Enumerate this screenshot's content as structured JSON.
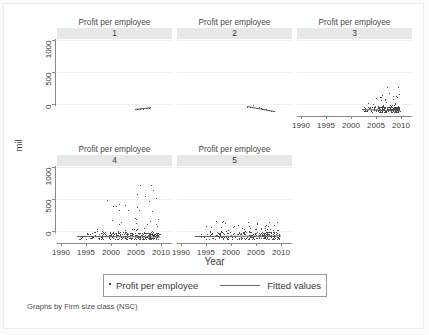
{
  "figure": {
    "y_axis_title": "mil",
    "x_axis_title": "Year",
    "footnote": "Graphs by Firm size class (NSC)",
    "panel_title": "Profit per employee"
  },
  "legend": {
    "marker_label": "Profit per employee",
    "line_label": "Fitted values"
  },
  "chart_data": {
    "type": "scatter",
    "title": "Profit per employee",
    "xlabel": "Year",
    "ylabel": "mil",
    "grid": true,
    "legend_position": "bottom",
    "xlim": [
      1988,
      2011
    ],
    "ylim": [
      -60,
      1180
    ],
    "xticks": [
      1990,
      1995,
      2000,
      2005,
      2010
    ],
    "yticks": [
      0,
      500,
      1000
    ],
    "facet_by": "Firm size class (NSC)",
    "panels": [
      {
        "id": "1",
        "strip_label": "1",
        "title": "Profit per employee",
        "row": 0,
        "col": 0,
        "n_points": 11,
        "x_axis_shown": false,
        "y_axis_shown": true,
        "points": [
          [
            2003.6,
            55
          ],
          [
            2003.9,
            48
          ],
          [
            2004.2,
            60
          ],
          [
            2004.5,
            52
          ],
          [
            2004.8,
            66
          ],
          [
            2005.1,
            58
          ],
          [
            2005.4,
            70
          ],
          [
            2005.7,
            62
          ],
          [
            2006.0,
            75
          ],
          [
            2006.3,
            68
          ],
          [
            2006.6,
            80
          ]
        ],
        "fit": {
          "x": [
            2003.5,
            2006.7
          ],
          "y": [
            50,
            78
          ]
        }
      },
      {
        "id": "2",
        "strip_label": "2",
        "title": "Profit per employee",
        "row": 0,
        "col": 1,
        "n_points": 14,
        "x_axis_shown": false,
        "y_axis_shown": false,
        "points": [
          [
            2002.0,
            92
          ],
          [
            2002.6,
            86
          ],
          [
            2003.2,
            120
          ],
          [
            2003.8,
            70
          ],
          [
            2004.3,
            78
          ],
          [
            2004.7,
            64
          ],
          [
            2005.0,
            58
          ],
          [
            2005.4,
            52
          ],
          [
            2005.8,
            46
          ],
          [
            2006.1,
            40
          ],
          [
            2006.4,
            34
          ],
          [
            2006.8,
            28
          ],
          [
            2007.1,
            22
          ],
          [
            2007.4,
            18
          ]
        ],
        "fit": {
          "x": [
            2002.0,
            2007.5
          ],
          "y": [
            95,
            15
          ]
        }
      },
      {
        "id": "3",
        "strip_label": "3",
        "title": "Profit per employee",
        "row": 0,
        "col": 2,
        "n_points": 210,
        "x_axis_shown": true,
        "y_axis_shown": false,
        "cluster": {
          "x_range": [
            2001.0,
            2008.5
          ],
          "y_core": [
            0,
            90
          ],
          "y_tail": 430
        },
        "fit": {
          "x": [
            2001.0,
            2008.6
          ],
          "y": [
            55,
            30
          ]
        }
      },
      {
        "id": "4",
        "strip_label": "4",
        "title": "Profit per employee",
        "row": 1,
        "col": 0,
        "n_points": 300,
        "x_axis_shown": true,
        "y_axis_shown": true,
        "cluster": {
          "x_range": [
            1992.0,
            2008.5
          ],
          "y_core": [
            0,
            110
          ],
          "y_tail": 880
        },
        "outliers": [
          [
            2004.6,
            870
          ],
          [
            2007.2,
            790
          ]
        ],
        "fit": {
          "x": [
            1992.0,
            2008.6
          ],
          "y": [
            58,
            52
          ]
        }
      },
      {
        "id": "5",
        "strip_label": "5",
        "title": "Profit per employee",
        "row": 1,
        "col": 1,
        "n_points": 280,
        "x_axis_shown": true,
        "y_axis_shown": false,
        "cluster": {
          "x_range": [
            1991.5,
            2008.5
          ],
          "y_core": [
            0,
            110
          ],
          "y_tail": 300
        },
        "fit": {
          "x": [
            1991.5,
            2008.6
          ],
          "y": [
            50,
            58
          ]
        }
      }
    ]
  }
}
